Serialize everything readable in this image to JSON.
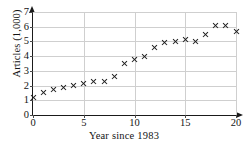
{
  "chart_data": {
    "type": "scatter",
    "title": "",
    "xlabel": "Year since 1983",
    "ylabel": "Articles (1,000)",
    "xlim": [
      0,
      20
    ],
    "ylim": [
      0,
      7
    ],
    "grid": true,
    "legend": "none",
    "marker": "x",
    "marker_color": "#1c1c1c",
    "xticks": [
      0,
      5,
      10,
      15,
      20
    ],
    "yticks": [
      0,
      1,
      2,
      3,
      4,
      5,
      6,
      7
    ],
    "xtick_labels": [
      "0",
      "5",
      "10",
      "15",
      "20"
    ],
    "ytick_labels": [
      "0",
      "1",
      "2",
      "3",
      "4",
      "5",
      "6",
      "7"
    ],
    "x": [
      0,
      1,
      2,
      3,
      4,
      5,
      6,
      7,
      8,
      9,
      10,
      11,
      12,
      13,
      14,
      15,
      16,
      17,
      18,
      19,
      20
    ],
    "values": [
      1.2,
      1.55,
      1.75,
      1.85,
      2.0,
      2.15,
      2.25,
      2.25,
      2.6,
      3.5,
      3.8,
      4.0,
      4.6,
      4.9,
      5.0,
      5.1,
      5.0,
      5.5,
      6.05,
      6.1,
      5.7
    ],
    "points": [
      {
        "x": 0,
        "y": 1.2
      },
      {
        "x": 1,
        "y": 1.55
      },
      {
        "x": 2,
        "y": 1.75
      },
      {
        "x": 3,
        "y": 1.85
      },
      {
        "x": 4,
        "y": 2.0
      },
      {
        "x": 5,
        "y": 2.15
      },
      {
        "x": 6,
        "y": 2.25
      },
      {
        "x": 7,
        "y": 2.25
      },
      {
        "x": 8,
        "y": 2.6
      },
      {
        "x": 9,
        "y": 3.5
      },
      {
        "x": 10,
        "y": 3.8
      },
      {
        "x": 11,
        "y": 4.0
      },
      {
        "x": 12,
        "y": 4.6
      },
      {
        "x": 13,
        "y": 4.9
      },
      {
        "x": 14,
        "y": 5.0
      },
      {
        "x": 15,
        "y": 5.1
      },
      {
        "x": 16,
        "y": 5.0
      },
      {
        "x": 17,
        "y": 5.5
      },
      {
        "x": 18,
        "y": 6.05
      },
      {
        "x": 19,
        "y": 6.1
      },
      {
        "x": 20,
        "y": 5.7
      }
    ]
  }
}
